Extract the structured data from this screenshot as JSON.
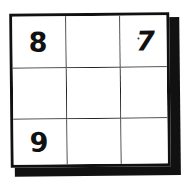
{
  "puzzle": {
    "type": "3x3 number grid",
    "rows": 3,
    "cols": 3,
    "cells": [
      [
        "8",
        "",
        "7"
      ],
      [
        "",
        "",
        ""
      ],
      [
        "9",
        "",
        ""
      ]
    ]
  },
  "colors": {
    "line": "#111111",
    "background": "#ffffff",
    "digit": "#111111"
  }
}
